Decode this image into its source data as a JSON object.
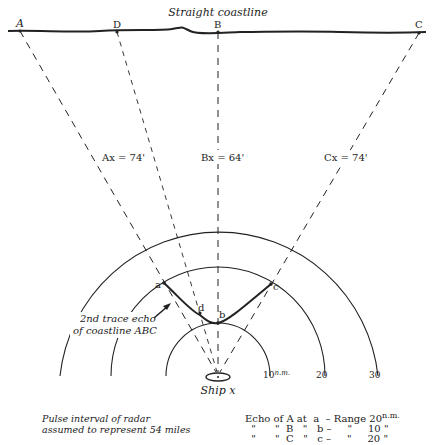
{
  "title": "Straight coastline",
  "coast_points": [
    {
      "label": "A",
      "x": 20,
      "y": 31
    },
    {
      "label": "D",
      "x": 117,
      "y": 32
    },
    {
      "label": "B",
      "x": 218,
      "y": 32
    },
    {
      "label": "C",
      "x": 419,
      "y": 33
    }
  ],
  "ship": {
    "label": "Ship x",
    "x": 218,
    "y": 376
  },
  "bearing_labels": {
    "ax": "Ax = 74'",
    "bx": "Bx = 64'",
    "cx": "Cx = 74'"
  },
  "range_rings": [
    {
      "label": "10",
      "unit": "n.m.",
      "radius": 52
    },
    {
      "label": "20",
      "radius": 106
    },
    {
      "label": "30",
      "radius": 160
    }
  ],
  "echo_points": {
    "a": "a",
    "b": "b",
    "c": "c",
    "d": "d"
  },
  "annotation": {
    "line1": "2nd trace echo",
    "line2": "of coastline ABC"
  },
  "caption": {
    "line1": "Pulse interval of radar",
    "line2": "assumed to represent 54 miles"
  },
  "legend": {
    "rows": [
      {
        "text": "Echo of A at  a  – Range 20",
        "unit": "n.m."
      },
      {
        "text": "  \"      \"  B   \"   b –     \"     10 \"",
        "unit": ""
      },
      {
        "text": "  \"      \"  C   \"   c –     \"     20 \"",
        "unit": ""
      }
    ]
  },
  "colors": {
    "ink": "#222222",
    "background": "#ffffff"
  }
}
